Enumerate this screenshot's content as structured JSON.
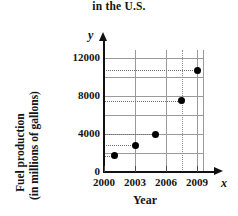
{
  "chart_data": {
    "type": "scatter",
    "title": "in the U.S.",
    "xlabel": "Year",
    "ylabel_line1": "Fuel production",
    "ylabel_line2": "(in millions of gallons)",
    "x_axis_variable": "x",
    "y_axis_variable": "y",
    "xlim": [
      2000,
      2010
    ],
    "ylim": [
      0,
      13000
    ],
    "x_tick_labels": [
      "2000",
      "2003",
      "2006",
      "2009"
    ],
    "x_tick_values": [
      2000,
      2003,
      2006,
      2009
    ],
    "y_tick_labels": [
      "0",
      "4000",
      "8000",
      "12000"
    ],
    "y_tick_values": [
      0,
      4000,
      8000,
      12000
    ],
    "y_gridline_values": [
      2000,
      4000,
      6000,
      8000,
      10000,
      12000
    ],
    "grid": true,
    "legend": "none",
    "points": [
      {
        "x": 2001,
        "y": 1700,
        "label": "2001, 1700"
      },
      {
        "x": 2003,
        "y": 2800,
        "label": "2003, 2800"
      },
      {
        "x": 2005,
        "y": 4000,
        "label": "2005, 4000"
      },
      {
        "x": 2007.5,
        "y": 7500,
        "label": "2007.5, 7500"
      },
      {
        "x": 2009,
        "y": 10700,
        "label": "2009, 10700"
      }
    ],
    "point_color": "#000000",
    "grid_color": "#9a9a9a",
    "axis_color": "#111111"
  }
}
